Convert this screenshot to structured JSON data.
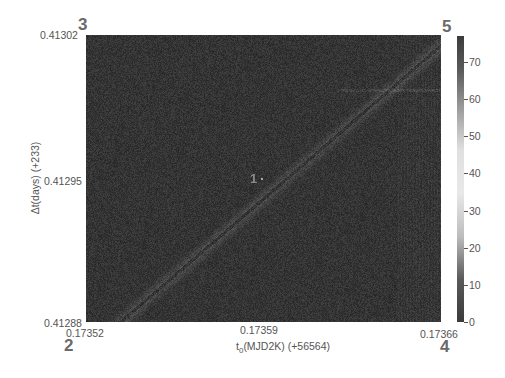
{
  "chart_data": {
    "type": "heatmap",
    "title": "",
    "xlabel": "t_0(MJD2K) (+56564)",
    "xlabel_main": "t",
    "xlabel_sub": "0",
    "xlabel_rest": "(MJD2K) (+56564)",
    "ylabel": "Δt(days) (+233)",
    "x_ticks": [
      "0.17352",
      "0.17359",
      "0.17366"
    ],
    "y_ticks": [
      "0.41288",
      "0.41295",
      "0.41302"
    ],
    "xlim": [
      0.17352,
      0.17366
    ],
    "ylim": [
      0.41288,
      0.41302
    ],
    "colorbar": {
      "ticks": [
        "0",
        "10",
        "20",
        "30",
        "40",
        "50",
        "60",
        "70"
      ],
      "range": [
        0,
        77
      ]
    },
    "features": [
      {
        "type": "diagonal_band",
        "from": [
          0.173535,
          0.41288
        ],
        "to": [
          0.17366,
          0.41301
        ],
        "description": "light diagonal streak of higher values"
      },
      {
        "type": "horizontal_streak",
        "y": 0.41299,
        "x_from": 0.1736,
        "x_to": 0.17366,
        "description": "faint horizontal light line"
      }
    ],
    "annotations": [
      {
        "label": "1",
        "x": 0.173592,
        "y": 0.41295,
        "position": "center"
      },
      {
        "label": "2",
        "position": "bottom-left corner"
      },
      {
        "label": "3",
        "position": "top-left corner"
      },
      {
        "label": "4",
        "position": "bottom-right corner"
      },
      {
        "label": "5",
        "position": "top-right corner"
      }
    ],
    "grid": false,
    "legend": "colorbar right"
  },
  "labels": {
    "corner_1": "1",
    "corner_2": "2",
    "corner_3": "3",
    "corner_4": "4",
    "corner_5": "5"
  }
}
